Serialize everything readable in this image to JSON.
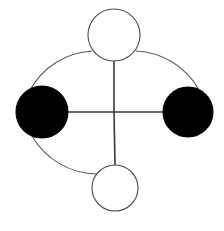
{
  "figure": {
    "width": 224,
    "height": 231,
    "background_color": "#ffffff"
  },
  "style": {
    "outline_color": "#4a4a4a",
    "filled_color": "#000000",
    "unfilled_color": "#ffffff",
    "node_stroke_width": 1.1,
    "edge_stroke_width": 1.6,
    "arc_stroke_width": 1.1
  },
  "nodes": [
    {
      "id": "node-top",
      "label": "top",
      "cx": 114,
      "cy": 35,
      "r": 26,
      "fill": "#ffffff",
      "stroke": "#4a4a4a",
      "state": "unfilled"
    },
    {
      "id": "node-left",
      "label": "left",
      "cx": 42,
      "cy": 112,
      "r": 26,
      "fill": "#000000",
      "stroke": "#000000",
      "state": "filled"
    },
    {
      "id": "node-right",
      "label": "right",
      "cx": 188,
      "cy": 112,
      "r": 25,
      "fill": "#000000",
      "stroke": "#000000",
      "state": "filled"
    },
    {
      "id": "node-bottom",
      "label": "bottom",
      "cx": 115,
      "cy": 188,
      "r": 23,
      "fill": "#ffffff",
      "stroke": "#4a4a4a",
      "state": "unfilled"
    }
  ],
  "center": {
    "id": "center-junction",
    "x": 114,
    "y": 112
  },
  "edges": [
    {
      "id": "edge-vertical-top",
      "label": "top to center",
      "x1": 114,
      "y1": 61,
      "x2": 114,
      "y2": 112,
      "stroke": "#3a3a3a"
    },
    {
      "id": "edge-vertical-bottom",
      "label": "center to bottom",
      "x1": 114,
      "y1": 112,
      "x2": 115,
      "y2": 165,
      "stroke": "#3a3a3a"
    },
    {
      "id": "edge-horizontal-left",
      "label": "left to center",
      "x1": 66,
      "y1": 112,
      "x2": 114,
      "y2": 112,
      "stroke": "#3a3a3a"
    },
    {
      "id": "edge-horizontal-right",
      "label": "center to right",
      "x1": 114,
      "y1": 112,
      "x2": 165,
      "y2": 112,
      "stroke": "#3a3a3a"
    }
  ],
  "arcs": [
    {
      "id": "arc-top-left",
      "label": "top to left outer arc",
      "path": "M 92 51 A 76 76 0 0 0 30 90",
      "stroke": "#5a5a5a",
      "present": true
    },
    {
      "id": "arc-top-right",
      "label": "top to right outer arc",
      "path": "M 136 51 A 76 76 0 0 1 199 90",
      "stroke": "#5a5a5a",
      "present": true
    },
    {
      "id": "arc-left-bottom",
      "label": "left to bottom outer arc",
      "path": "M 32 136 A 76 76 0 0 0 97 174",
      "stroke": "#5a5a5a",
      "present": true
    }
  ],
  "missing_arcs": [
    {
      "id": "arc-right-bottom",
      "label": "right to bottom outer arc (absent)",
      "present": false
    }
  ]
}
